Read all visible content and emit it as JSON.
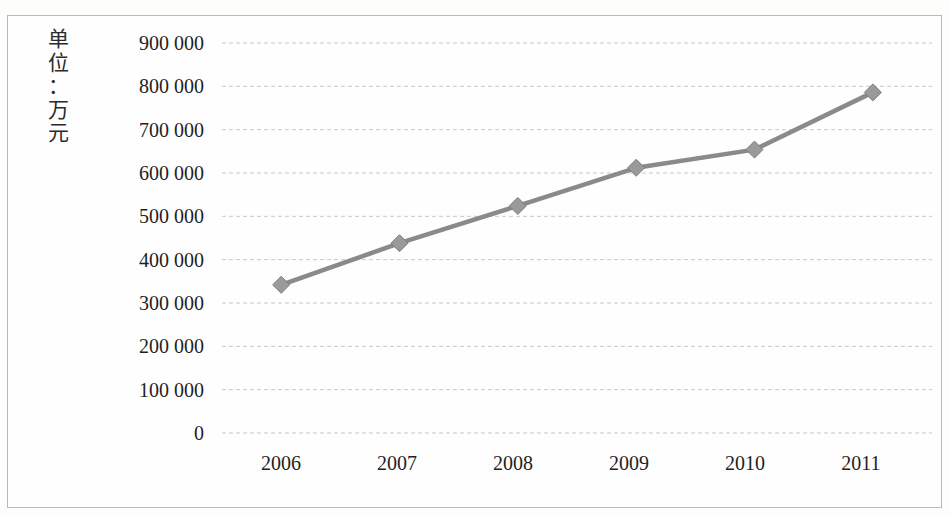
{
  "chart_data": {
    "type": "line",
    "title": "",
    "subtitle": "",
    "xlabel": "",
    "ylabel": "单位：万元",
    "ylabel_chars": [
      "单",
      "位",
      "：",
      "万",
      "元"
    ],
    "categories": [
      "2006",
      "2007",
      "2008",
      "2009",
      "2010",
      "2011"
    ],
    "series": [
      {
        "name": "",
        "values": [
          342000,
          438000,
          524000,
          612000,
          654000,
          786000
        ]
      }
    ],
    "y_tick_labels": [
      "900 000",
      "800 000",
      "700 000",
      "600 000",
      "500 000",
      "400 000",
      "300 000",
      "200 000",
      "100 000",
      "0"
    ],
    "y_tick_values": [
      900000,
      800000,
      700000,
      600000,
      500000,
      400000,
      300000,
      200000,
      100000,
      0
    ],
    "ylim": [
      0,
      900000
    ],
    "y_tick_step": 100000,
    "grid": "horizontal-dashed",
    "legend": "none",
    "marker": "diamond",
    "colors": {
      "line": "#8a8a8a",
      "marker_fill": "#9a9a9a",
      "marker_stroke": "#7d7d7d",
      "gridline": "#c8c8c8",
      "axis_line": "#c0c0c0",
      "border": "#b9b9b9",
      "text": "#1f1f1f",
      "background": "#fefefe"
    }
  }
}
